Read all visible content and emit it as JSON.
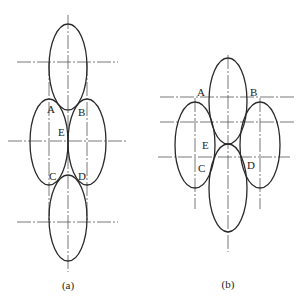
{
  "figures": [
    {
      "id": "a",
      "caption": "(a)",
      "points": [
        {
          "label": "A",
          "x": 51,
          "y": 112
        },
        {
          "label": "B",
          "x": 82,
          "y": 115
        },
        {
          "label": "E",
          "x": 59,
          "y": 135
        },
        {
          "label": "C",
          "x": 50,
          "y": 179
        },
        {
          "label": "D",
          "x": 79,
          "y": 179
        }
      ],
      "ellipses": [
        {
          "name": "top",
          "cx": 68,
          "cy": 67,
          "rx": 19,
          "ry": 43
        },
        {
          "name": "left",
          "cx": 49,
          "cy": 142,
          "rx": 19,
          "ry": 43
        },
        {
          "name": "right",
          "cx": 87,
          "cy": 142,
          "rx": 19,
          "ry": 43
        },
        {
          "name": "bottom",
          "cx": 68,
          "cy": 218,
          "rx": 19,
          "ry": 43
        }
      ]
    },
    {
      "id": "b",
      "caption": "(b)",
      "points": [
        {
          "label": "A",
          "x": 198,
          "y": 95
        },
        {
          "label": "B",
          "x": 251,
          "y": 95
        },
        {
          "label": "E",
          "x": 203,
          "y": 148
        },
        {
          "label": "C",
          "x": 199,
          "y": 171
        },
        {
          "label": "D",
          "x": 248,
          "y": 168
        }
      ],
      "ellipses": [
        {
          "name": "top",
          "cx": 228,
          "cy": 101,
          "rx": 19,
          "ry": 43
        },
        {
          "name": "left",
          "cx": 195,
          "cy": 145,
          "rx": 20,
          "ry": 43
        },
        {
          "name": "right",
          "cx": 261,
          "cy": 145,
          "rx": 20,
          "ry": 43
        },
        {
          "name": "bottom",
          "cx": 228,
          "cy": 188,
          "rx": 19,
          "ry": 44
        }
      ]
    }
  ],
  "labels": {
    "a": {
      "A": "A",
      "B": "B",
      "E": "E",
      "C": "C",
      "D": "D",
      "caption": "(a)"
    },
    "b": {
      "A": "A",
      "B": "B",
      "E": "E",
      "C": "C",
      "D": "D",
      "caption": "(b)"
    }
  }
}
